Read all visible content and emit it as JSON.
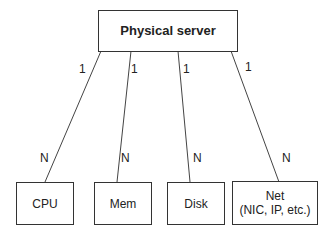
{
  "root": {
    "label": "Physical server"
  },
  "children": [
    {
      "label": "CPU",
      "label2": "",
      "parent_card": "1",
      "child_card": "N"
    },
    {
      "label": "Mem",
      "label2": "",
      "parent_card": "1",
      "child_card": "N"
    },
    {
      "label": "Disk",
      "label2": "",
      "parent_card": "1",
      "child_card": "N"
    },
    {
      "label": "Net",
      "label2": "(NIC, IP, etc.)",
      "parent_card": "1",
      "child_card": "N"
    }
  ]
}
